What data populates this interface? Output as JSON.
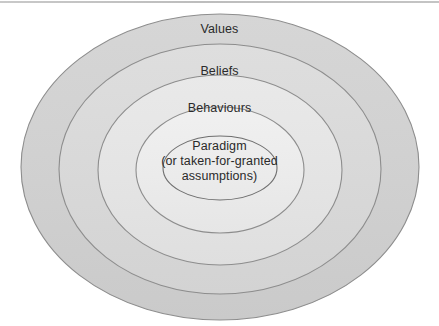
{
  "diagram": {
    "type": "concentric-ellipses",
    "title": "",
    "background_color": "#ffffff",
    "stroke_color": "#8a8a8a",
    "top_rule_color": "#c2c2c2",
    "text_color": "#2a2a2a",
    "rings": [
      {
        "id": "values",
        "label": "Values",
        "fill_color": "#d2d2d2",
        "level": 1
      },
      {
        "id": "beliefs",
        "label": "Beliefs",
        "fill_color": "#dadada",
        "level": 2
      },
      {
        "id": "behaviours",
        "label": "Behaviours",
        "fill_color": "#e5e5e5",
        "level": 3
      },
      {
        "id": "paradigm",
        "label": "Paradigm",
        "label_lines": [
          "Paradigm",
          "(or taken-for-granted",
          "assumptions)"
        ],
        "fill_color": "#ececec",
        "level": 4
      }
    ]
  }
}
